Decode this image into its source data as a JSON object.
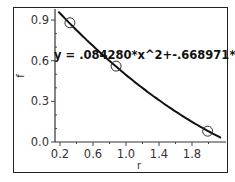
{
  "chart_data": {
    "type": "scatter",
    "title": "",
    "xlabel": "r",
    "ylabel": "f",
    "xlim": [
      0.15,
      2.15
    ],
    "ylim": [
      0.0,
      0.95
    ],
    "x_ticks": [
      0.2,
      0.6,
      1.0,
      1.4,
      1.8
    ],
    "x_tick_labels": [
      "0.2",
      "0.6",
      "1.0",
      "1.4",
      "1.8"
    ],
    "y_ticks": [
      0.0,
      0.3,
      0.6,
      0.9
    ],
    "y_tick_labels": [
      "0.0",
      "0.3",
      "0.6",
      "0.9"
    ],
    "grid": false,
    "legend": null,
    "series": [
      {
        "name": "data",
        "marker": "open-circle",
        "x": [
          0.32,
          0.88,
          1.99
        ],
        "y": [
          0.88,
          0.56,
          0.08
        ]
      },
      {
        "name": "fit",
        "type": "line",
        "equation": "y = .084280*x^2+-.668971*x+1.08",
        "coefficients": {
          "a": 0.08428,
          "b": -0.668971,
          "c": 1.08
        },
        "x_range": [
          0.18,
          2.15
        ]
      }
    ],
    "annotations": [
      {
        "text": "y = .084280*x^2+-.668971*x+1.08",
        "x": 0.2,
        "y": 0.62
      }
    ]
  },
  "colors": {
    "line": "#111111",
    "marker": "#333333",
    "frame": "#222222"
  }
}
